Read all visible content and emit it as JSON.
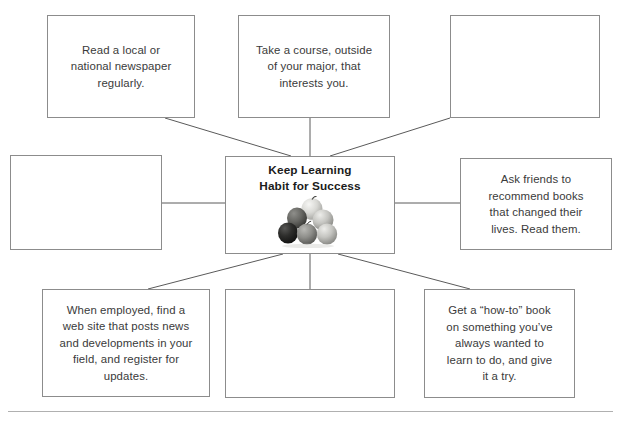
{
  "diagram": {
    "title": "Keep Learning Habit for Success",
    "center": {
      "title_line_1": "Keep Learning",
      "title_line_2": "Habit for Success",
      "title": "Keep Learning\nHabit for Success",
      "image_name": "apple-pyramid-image",
      "image_description": "grayscale photo of six apples stacked in a pyramid"
    },
    "nodes": [
      {
        "id": "top-left",
        "position": "top-left",
        "text": "Read a local or\nnational newspaper\nregularly.",
        "empty": false
      },
      {
        "id": "top-mid",
        "position": "top-center",
        "text": "Take a course, outside\nof your major, that\ninterests you.",
        "empty": false
      },
      {
        "id": "top-right",
        "position": "top-right",
        "text": "",
        "empty": true
      },
      {
        "id": "mid-left",
        "position": "middle-left",
        "text": "",
        "empty": true
      },
      {
        "id": "mid-right",
        "position": "middle-right",
        "text": "Ask friends to\nrecommend books\nthat changed their\nlives. Read them.",
        "empty": false
      },
      {
        "id": "bot-left",
        "position": "bottom-left",
        "text": "When employed, find a\nweb site that posts news\nand developments in your\nfield, and register for\nupdates.",
        "empty": false
      },
      {
        "id": "bot-mid",
        "position": "bottom-center",
        "text": "",
        "empty": true
      },
      {
        "id": "bot-right",
        "position": "bottom-right",
        "text": "Get a “how-to” book\non something you’ve\nalways wanted to\nlearn to do, and give\nit a try.",
        "empty": false
      }
    ],
    "colors": {
      "box_border": "#8c8c8c",
      "connector_line": "#5a5a5a",
      "body_text": "#3a3a3a",
      "center_title_text": "#1b1b1b",
      "footer_rule": "#b0b0b0",
      "background": "#ffffff"
    }
  }
}
